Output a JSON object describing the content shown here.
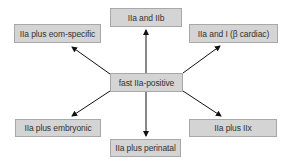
{
  "diagram": {
    "center": {
      "label": "fast IIa-positive"
    },
    "nodes": [
      {
        "id": "top",
        "label": "IIa and IIb"
      },
      {
        "id": "top-left",
        "label": "IIa plus eom-specific"
      },
      {
        "id": "top-right",
        "label": "IIa and I (β cardiac)"
      },
      {
        "id": "bottom-left",
        "label": "IIa plus embryonic"
      },
      {
        "id": "bottom",
        "label": "IIa plus perinatal"
      },
      {
        "id": "bottom-right",
        "label": "IIa plus IIx"
      }
    ],
    "edges": [
      {
        "from": "center",
        "to": "top"
      },
      {
        "from": "center",
        "to": "top-left"
      },
      {
        "from": "center",
        "to": "top-right"
      },
      {
        "from": "center",
        "to": "bottom-left"
      },
      {
        "from": "center",
        "to": "bottom"
      },
      {
        "from": "center",
        "to": "bottom-right"
      }
    ],
    "colors": {
      "box_fill": "#d4d4d4",
      "box_border": "#a8a8a8",
      "arrow": "#111111",
      "text": "#333333"
    }
  }
}
